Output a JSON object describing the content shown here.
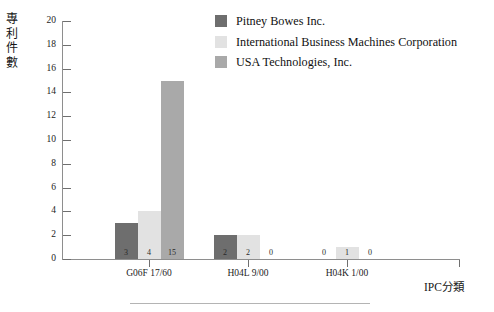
{
  "chart_data": {
    "type": "bar",
    "title": "",
    "xlabel": "IPC分類",
    "ylabel": "專利件數",
    "categories": [
      "G06F 17/60",
      "H04L 9/00",
      "H04K 1/00"
    ],
    "series": [
      {
        "name": "Pitney Bowes Inc.",
        "color": "#6e6e6e",
        "values": [
          3,
          2,
          0
        ]
      },
      {
        "name": "International Business Machines Corporation",
        "color": "#e2e2e2",
        "values": [
          4,
          2,
          1
        ]
      },
      {
        "name": "USA Technologies, Inc.",
        "color": "#a9a9a9",
        "values": [
          15,
          0,
          0
        ]
      }
    ],
    "ylim": [
      0,
      20
    ],
    "yticks": [
      0,
      2,
      4,
      6,
      8,
      10,
      12,
      14,
      16,
      18,
      20
    ],
    "ytick_labels": [
      "0",
      "2",
      "4",
      "6",
      "8",
      "10",
      "12",
      "14",
      "16",
      "18",
      "20"
    ],
    "grid": false,
    "legend_position": "top-right",
    "data_labels": true,
    "bar_value_labels": [
      [
        "3",
        "4",
        "15"
      ],
      [
        "2",
        "2",
        "0"
      ],
      [
        "0",
        "1",
        "0"
      ]
    ]
  },
  "axes": {
    "y_title_chars": [
      "專",
      "利",
      "件",
      "數"
    ],
    "x_title": "IPC分類"
  },
  "legend": {
    "items": [
      {
        "label": "Pitney Bowes Inc.",
        "color": "#6e6e6e"
      },
      {
        "label": "International Business Machines Corporation",
        "color": "#e2e2e2"
      },
      {
        "label": "USA Technologies, Inc.",
        "color": "#a9a9a9"
      }
    ]
  },
  "colors": {
    "axis": "#8e8e8e",
    "tick": "#6f6f6f",
    "text": "#1c1c1c",
    "footer_rule": "#b4b4b4",
    "series_1": "#6e6e6e",
    "series_2": "#e2e2e2",
    "series_3": "#a9a9a9"
  }
}
